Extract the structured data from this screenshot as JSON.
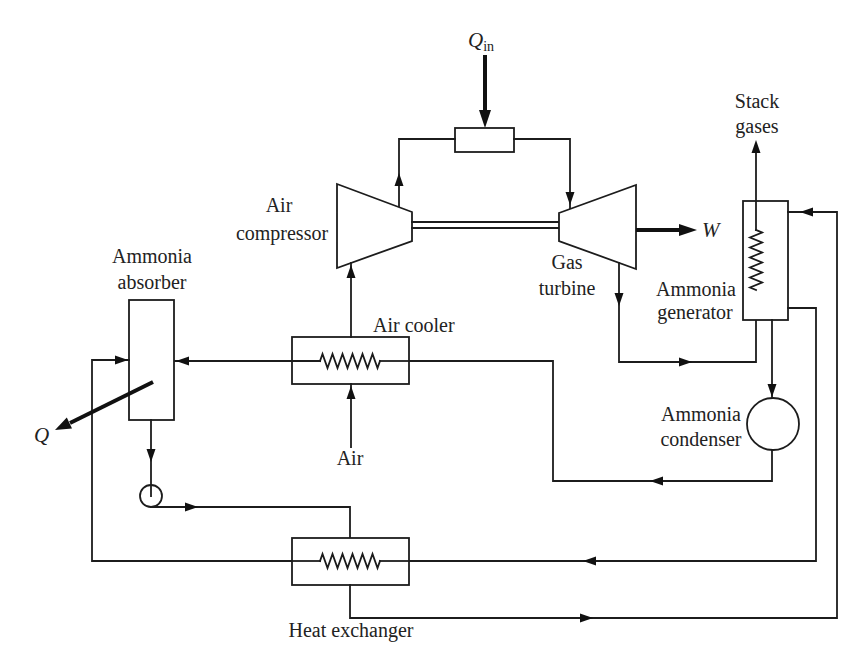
{
  "style": {
    "background": "#ffffff",
    "line_color": "#1c1c1c"
  },
  "components": {
    "combustor": {
      "label": ""
    },
    "air_compressor": {
      "label_lines": [
        "Air",
        "compressor"
      ]
    },
    "gas_turbine": {
      "label_lines": [
        "Gas",
        "turbine"
      ]
    },
    "ammonia_absorber": {
      "label_lines": [
        "Ammonia",
        "absorber"
      ]
    },
    "air_cooler": {
      "label": "Air cooler"
    },
    "ammonia_generator": {
      "label_lines": [
        "Ammonia",
        "generator"
      ]
    },
    "ammonia_condenser": {
      "label_lines": [
        "Ammonia",
        "condenser"
      ]
    },
    "heat_exchanger": {
      "label": "Heat exchanger"
    },
    "pump": {
      "label": ""
    }
  },
  "streams": {
    "heat_input": {
      "symbol": "Q",
      "subscript": "in"
    },
    "work_output": {
      "symbol": "W"
    },
    "heat_rejected": {
      "symbol": "Q"
    },
    "air_inlet": {
      "label": "Air"
    },
    "stack_gases": {
      "label_lines": [
        "Stack",
        "gases"
      ]
    }
  }
}
